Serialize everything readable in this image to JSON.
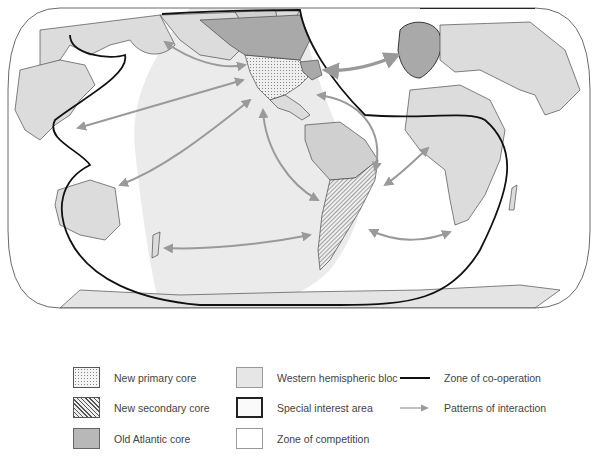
{
  "figure": {
    "type": "thematic world map",
    "projection": "rounded equal-area world projection",
    "colors": {
      "land": "#dcdcdc",
      "ocean": "#ffffff",
      "western_hemispheric_bloc": "#e8e8e8",
      "old_atlantic_core": "#a9a9a9",
      "coastline": "#333333",
      "zone_of_cooperation_line": "#111111",
      "interaction_arrow": "#9a9a9a"
    }
  },
  "map": {
    "regions": [
      {
        "name": "New primary core",
        "pattern": "dots",
        "location": "United States (west/central)"
      },
      {
        "name": "New secondary core",
        "pattern": "hatch",
        "location": "Southern South America (Brazil south, Argentina, Chile)"
      },
      {
        "name": "Old Atlantic core",
        "pattern": "dark-gray",
        "location": "Western Europe and northeastern United States"
      },
      {
        "name": "Western hemispheric bloc",
        "pattern": "light-gray",
        "location": "The Americas and surrounding oceans"
      },
      {
        "name": "Special interest area",
        "pattern": "bold-outline",
        "location": "Europe/Africa bounded area; East Asia/Pacific bounded area"
      }
    ],
    "interactions": [
      {
        "from": "North America",
        "to": "East Asia (Kamchatka/Japan)"
      },
      {
        "from": "North America",
        "to": "Southeast Asia"
      },
      {
        "from": "North America",
        "to": "Australia"
      },
      {
        "from": "Northeast US",
        "to": "Western Europe"
      },
      {
        "from": "North America",
        "to": "South America"
      },
      {
        "from": "South America",
        "to": "West Africa"
      },
      {
        "from": "South America",
        "to": "Southern Africa"
      },
      {
        "from": "South America",
        "to": "New Zealand"
      },
      {
        "from": "South America",
        "to": "Pacific"
      }
    ]
  },
  "legend": {
    "column1": [
      {
        "label": "New primary core",
        "symbol": "dots"
      },
      {
        "label": "New secondary core",
        "symbol": "hatch"
      },
      {
        "label": "Old Atlantic core",
        "symbol": "old"
      }
    ],
    "column2": [
      {
        "label": "Western hemispheric bloc",
        "symbol": "western"
      },
      {
        "label": "Special interest area",
        "symbol": "special"
      },
      {
        "label": "Zone of competition",
        "symbol": "competition"
      }
    ],
    "column3": [
      {
        "label": "Zone of co-operation",
        "symbol": "line"
      },
      {
        "label": "Patterns of interaction",
        "symbol": "arrow"
      }
    ]
  }
}
